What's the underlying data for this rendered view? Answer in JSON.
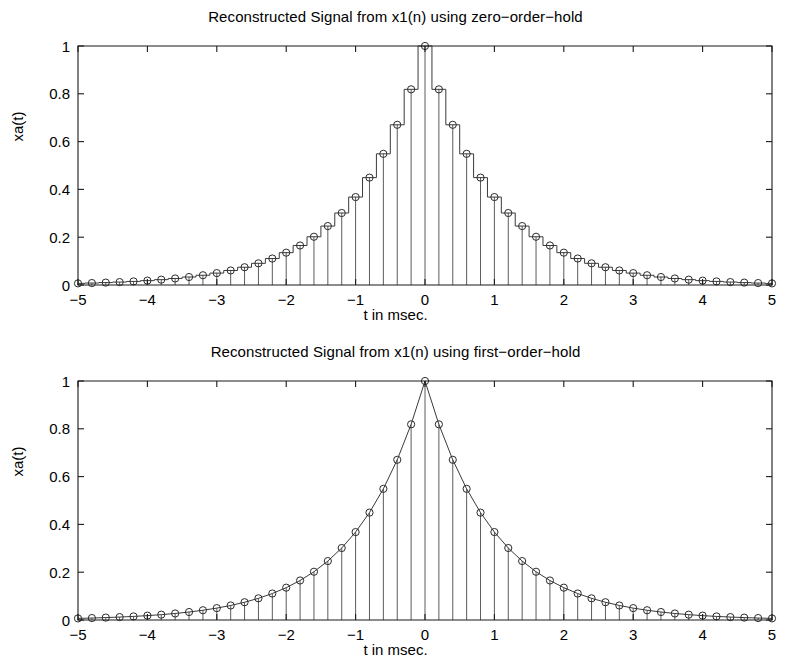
{
  "figure": {
    "background": "#ffffff",
    "foreground": "#1a1a1a",
    "marker_color": "#2b2b2b",
    "stem_color": "#4a4a4a"
  },
  "plots": {
    "top": {
      "title": "Reconstructed Signal from x1(n) using zero−order−hold",
      "xlabel": "t in msec.",
      "ylabel": "xa(t)"
    },
    "bottom": {
      "title": "Reconstructed Signal from x1(n) using first−order−hold",
      "xlabel": "t in msec.",
      "ylabel": "xa(t)"
    }
  },
  "chart_data": [
    {
      "type": "line",
      "title": "Reconstructed Signal from x1(n) using zero−order−hold",
      "xlabel": "t in msec.",
      "ylabel": "xa(t)",
      "interpolation": "zero-order-hold",
      "markers": "circle",
      "stems": true,
      "grid": false,
      "legend": null,
      "xlim": [
        -5,
        5
      ],
      "ylim": [
        0,
        1
      ],
      "xticks": [
        -5,
        -4,
        -3,
        -2,
        -1,
        0,
        1,
        2,
        3,
        4,
        5
      ],
      "xticklabels": [
        "−5",
        "−4",
        "−3",
        "−2",
        "−1",
        "0",
        "1",
        "2",
        "3",
        "4",
        "5"
      ],
      "yticks": [
        0,
        0.2,
        0.4,
        0.6,
        0.8,
        1
      ],
      "yticklabels": [
        "0",
        "0.2",
        "0.4",
        "0.6",
        "0.8",
        "1"
      ],
      "sample_interval": 0.2,
      "x": [
        -5,
        -4.8,
        -4.6,
        -4.4,
        -4.2,
        -4,
        -3.8,
        -3.6,
        -3.4,
        -3.2,
        -3,
        -2.8,
        -2.6,
        -2.4,
        -2.2,
        -2,
        -1.8,
        -1.6,
        -1.4,
        -1.2,
        -1,
        -0.8,
        -0.6,
        -0.4,
        -0.2,
        0,
        0.2,
        0.4,
        0.6,
        0.8,
        1,
        1.2,
        1.4,
        1.6,
        1.8,
        2,
        2.2,
        2.4,
        2.6,
        2.8,
        3,
        3.2,
        3.4,
        3.6,
        3.8,
        4,
        4.2,
        4.4,
        4.6,
        4.8,
        5
      ],
      "values": [
        0.0067,
        0.0082,
        0.0101,
        0.0123,
        0.015,
        0.0183,
        0.0224,
        0.0273,
        0.0334,
        0.0408,
        0.0498,
        0.0608,
        0.0743,
        0.0907,
        0.1108,
        0.1353,
        0.1653,
        0.2019,
        0.2466,
        0.3012,
        0.3679,
        0.4493,
        0.5488,
        0.6703,
        0.8187,
        1.0,
        0.8187,
        0.6703,
        0.5488,
        0.4493,
        0.3679,
        0.3012,
        0.2466,
        0.2019,
        0.1653,
        0.1353,
        0.1108,
        0.0907,
        0.0743,
        0.0608,
        0.0498,
        0.0408,
        0.0334,
        0.0273,
        0.0224,
        0.0183,
        0.015,
        0.0123,
        0.0101,
        0.0082,
        0.0067
      ]
    },
    {
      "type": "line",
      "title": "Reconstructed Signal from x1(n) using first−order−hold",
      "xlabel": "t in msec.",
      "ylabel": "xa(t)",
      "interpolation": "first-order-hold",
      "markers": "circle",
      "stems": true,
      "grid": false,
      "legend": null,
      "xlim": [
        -5,
        5
      ],
      "ylim": [
        0,
        1
      ],
      "xticks": [
        -5,
        -4,
        -3,
        -2,
        -1,
        0,
        1,
        2,
        3,
        4,
        5
      ],
      "xticklabels": [
        "−5",
        "−4",
        "−3",
        "−2",
        "−1",
        "0",
        "1",
        "2",
        "3",
        "4",
        "5"
      ],
      "yticks": [
        0,
        0.2,
        0.4,
        0.6,
        0.8,
        1
      ],
      "yticklabels": [
        "0",
        "0.2",
        "0.4",
        "0.6",
        "0.8",
        "1"
      ],
      "sample_interval": 0.2,
      "x": [
        -5,
        -4.8,
        -4.6,
        -4.4,
        -4.2,
        -4,
        -3.8,
        -3.6,
        -3.4,
        -3.2,
        -3,
        -2.8,
        -2.6,
        -2.4,
        -2.2,
        -2,
        -1.8,
        -1.6,
        -1.4,
        -1.2,
        -1,
        -0.8,
        -0.6,
        -0.4,
        -0.2,
        0,
        0.2,
        0.4,
        0.6,
        0.8,
        1,
        1.2,
        1.4,
        1.6,
        1.8,
        2,
        2.2,
        2.4,
        2.6,
        2.8,
        3,
        3.2,
        3.4,
        3.6,
        3.8,
        4,
        4.2,
        4.4,
        4.6,
        4.8,
        5
      ],
      "values": [
        0.0067,
        0.0082,
        0.0101,
        0.0123,
        0.015,
        0.0183,
        0.0224,
        0.0273,
        0.0334,
        0.0408,
        0.0498,
        0.0608,
        0.0743,
        0.0907,
        0.1108,
        0.1353,
        0.1653,
        0.2019,
        0.2466,
        0.3012,
        0.3679,
        0.4493,
        0.5488,
        0.6703,
        0.8187,
        1.0,
        0.8187,
        0.6703,
        0.5488,
        0.4493,
        0.3679,
        0.3012,
        0.2466,
        0.2019,
        0.1653,
        0.1353,
        0.1108,
        0.0907,
        0.0743,
        0.0608,
        0.0498,
        0.0408,
        0.0334,
        0.0273,
        0.0224,
        0.0183,
        0.015,
        0.0123,
        0.0101,
        0.0082,
        0.0067
      ]
    }
  ]
}
